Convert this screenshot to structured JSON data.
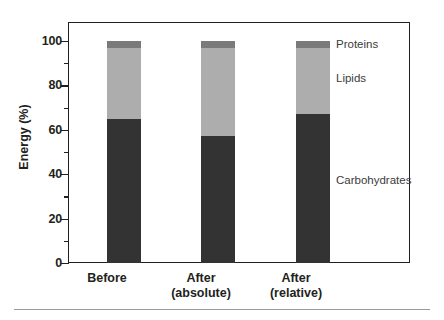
{
  "chart_data": {
    "type": "bar",
    "subtype": "stacked-bar",
    "title": "",
    "subtitle": "",
    "xlabel": "",
    "ylabel": "Energy (%)",
    "ylim": [
      0,
      100
    ],
    "yticks": [
      0,
      20,
      40,
      60,
      80,
      100
    ],
    "ytick_labels": [
      "0",
      "20",
      "40",
      "60",
      "80",
      "100"
    ],
    "yminor_ticks": [
      10,
      30,
      50,
      70,
      90
    ],
    "grid": false,
    "legend_position": "in-plot-right",
    "categories": [
      "Before",
      "After (absolute)",
      "After (relative)"
    ],
    "category_labels": [
      {
        "line1": "Before",
        "line2": ""
      },
      {
        "line1": "After",
        "line2": "(absolute)"
      },
      {
        "line1": "After",
        "line2": "(relative)"
      }
    ],
    "series": [
      {
        "name": "Carbohydrates",
        "color": "#333333",
        "values": [
          65,
          57,
          67
        ]
      },
      {
        "name": "Lipids",
        "color": "#adadad",
        "values": [
          32,
          40,
          30
        ]
      },
      {
        "name": "Proteins",
        "color": "#7a7a7a",
        "values": [
          3,
          3,
          3
        ]
      }
    ],
    "annotations": [
      {
        "text": "Proteins",
        "series": "Proteins"
      },
      {
        "text": "Lipids",
        "series": "Lipids"
      },
      {
        "text": "Carbohydrates",
        "series": "Carbohydrates"
      }
    ]
  },
  "axis": {
    "y_title": "Energy (%)",
    "ticks": {
      "t0": "0",
      "t20": "20",
      "t40": "40",
      "t60": "60",
      "t80": "80",
      "t100": "100"
    }
  },
  "labels": {
    "cat0_line1": "Before",
    "cat0_line2": "",
    "cat1_line1": "After",
    "cat1_line2": "(absolute)",
    "cat2_line1": "After",
    "cat2_line2": "(relative)",
    "series_proteins": "Proteins",
    "series_lipids": "Lipids",
    "series_carbohydrates": "Carbohydrates"
  },
  "colors": {
    "carbohydrates": "#333333",
    "lipids": "#adadad",
    "proteins": "#7a7a7a",
    "frame": "#231f20",
    "text": "#231f20",
    "rule": "#9a9a9a"
  }
}
